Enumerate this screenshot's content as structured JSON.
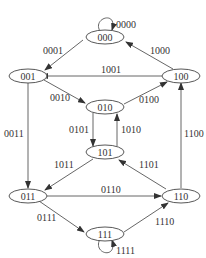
{
  "diagram": {
    "type": "state-transition-diagram",
    "nodes": [
      {
        "id": "000",
        "label": "000"
      },
      {
        "id": "001",
        "label": "001"
      },
      {
        "id": "100",
        "label": "100"
      },
      {
        "id": "010",
        "label": "010"
      },
      {
        "id": "101",
        "label": "101"
      },
      {
        "id": "011",
        "label": "011"
      },
      {
        "id": "110",
        "label": "110"
      },
      {
        "id": "111",
        "label": "111"
      }
    ],
    "edges": [
      {
        "from": "000",
        "to": "000",
        "label": "0000"
      },
      {
        "from": "000",
        "to": "001",
        "label": "0001"
      },
      {
        "from": "100",
        "to": "000",
        "label": "1000"
      },
      {
        "from": "100",
        "to": "001",
        "label": "1001"
      },
      {
        "from": "001",
        "to": "010",
        "label": "0010"
      },
      {
        "from": "010",
        "to": "100",
        "label": "0100"
      },
      {
        "from": "001",
        "to": "011",
        "label": "0011"
      },
      {
        "from": "010",
        "to": "101",
        "label": "0101"
      },
      {
        "from": "101",
        "to": "010",
        "label": "1010"
      },
      {
        "from": "110",
        "to": "100",
        "label": "1100"
      },
      {
        "from": "101",
        "to": "011",
        "label": "1011"
      },
      {
        "from": "110",
        "to": "101",
        "label": "1101"
      },
      {
        "from": "011",
        "to": "110",
        "label": "0110"
      },
      {
        "from": "011",
        "to": "111",
        "label": "0111"
      },
      {
        "from": "111",
        "to": "110",
        "label": "1110"
      },
      {
        "from": "111",
        "to": "111",
        "label": "1111"
      }
    ]
  }
}
